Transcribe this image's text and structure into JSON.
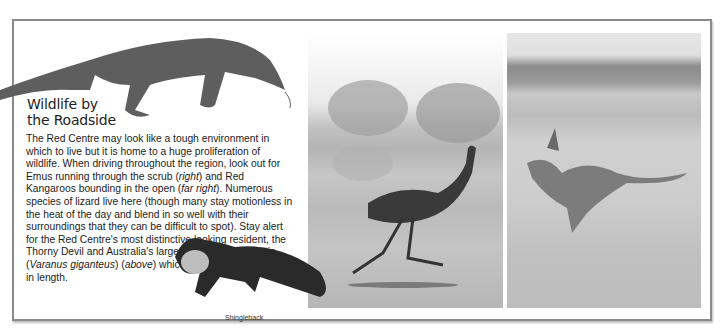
{
  "article": {
    "heading_line1": "Wildlife by",
    "heading_line2": "the Roadside",
    "body": {
      "p1": "The Red Centre may look like a tough environment in which to live but it is home to a huge proliferation of wildlife. When driving throughout the region, look out for Emus running through the scrub (",
      "right": "right",
      "p2": ") and Red Kangaroos bounding in the open (",
      "far_right": "far right",
      "p3": "). Numerous species of lizard live here (though many stay motionless in the heat of the day and blend in so well with their surroundings that they can be difficult to spot). Stay alert for the Red Centre's most distinctive looking resident, the Thorny Devil and Australia's largest lizard, the Perentie (",
      "latin": "Varanus giganteus",
      "p4": ") (",
      "above": "above",
      "p5": ") which can grow to over 2.5 m in length."
    }
  },
  "images": {
    "perentie": "perentie-lizard-photo",
    "shingleback": "shingleback-lizard-photo",
    "emu": "emu-running-photo",
    "kangaroo": "red-kangaroo-bounding-photo"
  },
  "captions": {
    "shingleback": "Shingleback"
  }
}
